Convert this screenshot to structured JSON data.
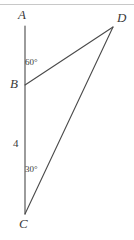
{
  "figure": {
    "type": "geometry-diagram",
    "background_color": "#ffffff",
    "stroke_color": "#4a4a4a",
    "text_color": "#3a3a3a",
    "top_rule_color": "#c8c8c8",
    "width": 134,
    "height": 240
  },
  "points": {
    "A": {
      "label": "A",
      "x": 25,
      "y": 26
    },
    "B": {
      "label": "B",
      "x": 25,
      "y": 85
    },
    "C": {
      "label": "C",
      "x": 25,
      "y": 214
    },
    "D": {
      "label": "D",
      "x": 113,
      "y": 27
    }
  },
  "segments": [
    {
      "name": "AC",
      "from": "A",
      "to": "C"
    },
    {
      "name": "BD",
      "from": "B",
      "to": "D"
    },
    {
      "name": "CD",
      "from": "C",
      "to": "D"
    }
  ],
  "angles": {
    "at_B": {
      "label": "60°",
      "value": 60,
      "unit": "degrees"
    },
    "at_C": {
      "label": "30°",
      "value": 30,
      "unit": "degrees"
    }
  },
  "lengths": {
    "BC": {
      "label": "4",
      "value": 4
    }
  }
}
